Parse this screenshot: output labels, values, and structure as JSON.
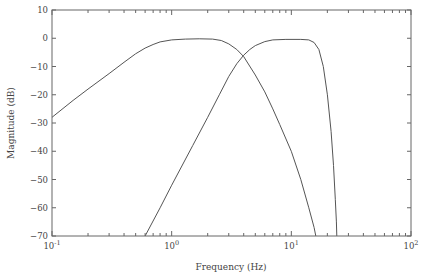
{
  "chart_data": {
    "type": "line",
    "title": "",
    "xlabel": "Frequency (Hz)",
    "ylabel": "Magnitude (dB)",
    "xscale": "log",
    "xlim": [
      0.1,
      100
    ],
    "ylim": [
      -70,
      10
    ],
    "grid": false,
    "legend": null,
    "x_ticks": [
      {
        "value": 0.1,
        "base": "10",
        "exp": "-1"
      },
      {
        "value": 1,
        "base": "10",
        "exp": "0"
      },
      {
        "value": 10,
        "base": "10",
        "exp": "1"
      },
      {
        "value": 100,
        "base": "10",
        "exp": "2"
      }
    ],
    "y_ticks": [
      10,
      0,
      -10,
      -20,
      -30,
      -40,
      -50,
      -60,
      -70
    ],
    "series": [
      {
        "name": "curve-1",
        "color": "#555555",
        "points": [
          [
            0.1,
            -28
          ],
          [
            0.15,
            -22
          ],
          [
            0.2,
            -18
          ],
          [
            0.3,
            -12.5
          ],
          [
            0.4,
            -8.5
          ],
          [
            0.5,
            -5.5
          ],
          [
            0.6,
            -3.5
          ],
          [
            0.7,
            -2.2
          ],
          [
            0.8,
            -1.3
          ],
          [
            1.0,
            -0.6
          ],
          [
            1.3,
            -0.3
          ],
          [
            1.7,
            -0.2
          ],
          [
            2.2,
            -0.3
          ],
          [
            2.6,
            -0.8
          ],
          [
            3.0,
            -2
          ],
          [
            3.5,
            -4
          ],
          [
            4.0,
            -6.5
          ],
          [
            5.0,
            -13
          ],
          [
            6.0,
            -19
          ],
          [
            7.0,
            -25
          ],
          [
            8.0,
            -30.5
          ],
          [
            10.0,
            -40
          ],
          [
            12.0,
            -50
          ],
          [
            14.0,
            -60
          ],
          [
            15.5,
            -67
          ],
          [
            16.0,
            -70
          ]
        ]
      },
      {
        "name": "curve-2",
        "color": "#555555",
        "points": [
          [
            0.6,
            -70
          ],
          [
            0.8,
            -60
          ],
          [
            1.0,
            -52
          ],
          [
            1.5,
            -38
          ],
          [
            2.0,
            -28
          ],
          [
            2.5,
            -20
          ],
          [
            3.0,
            -13.5
          ],
          [
            3.5,
            -9
          ],
          [
            4.0,
            -6
          ],
          [
            4.5,
            -4
          ],
          [
            5.0,
            -2.6
          ],
          [
            6.0,
            -1.2
          ],
          [
            7.0,
            -0.6
          ],
          [
            9.0,
            -0.4
          ],
          [
            12.0,
            -0.4
          ],
          [
            14.0,
            -0.6
          ],
          [
            15.5,
            -1.5
          ],
          [
            17.0,
            -4
          ],
          [
            18.5,
            -10
          ],
          [
            20.0,
            -20
          ],
          [
            21.5,
            -33
          ],
          [
            22.5,
            -45
          ],
          [
            23.3,
            -57
          ],
          [
            23.8,
            -65
          ],
          [
            24.0,
            -70
          ]
        ]
      }
    ]
  }
}
